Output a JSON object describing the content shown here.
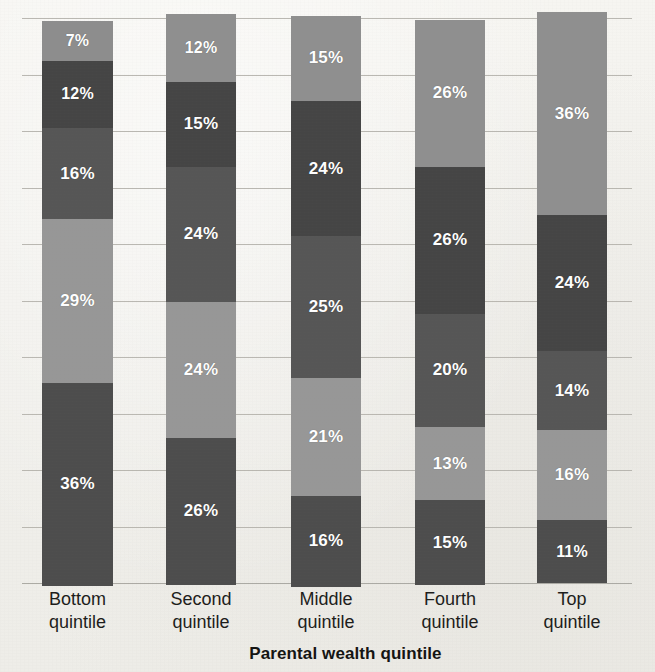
{
  "chart_data": {
    "type": "bar",
    "subtype": "stacked-100-percent",
    "title": "",
    "subtitle": "",
    "xlabel": "Parental wealth quintile",
    "ylabel": "",
    "categories": [
      "Bottom quintile",
      "Second quintile",
      "Middle quintile",
      "Fourth quintile",
      "Top quintile"
    ],
    "category_lines": [
      [
        "Bottom",
        "quintile"
      ],
      [
        "Second",
        "quintile"
      ],
      [
        "Middle",
        "quintile"
      ],
      [
        "Fourth",
        "quintile"
      ],
      [
        "Top",
        "quintile"
      ]
    ],
    "stack_order": "top-to-bottom",
    "series": [
      {
        "name": "Segment 1 (top)",
        "values": [
          7,
          12,
          15,
          26,
          36
        ],
        "color": "#8d8d8d"
      },
      {
        "name": "Segment 2",
        "values": [
          12,
          15,
          24,
          26,
          24
        ],
        "color": "#4b4b4b"
      },
      {
        "name": "Segment 3",
        "values": [
          16,
          24,
          25,
          20,
          14
        ],
        "color": "#555555"
      },
      {
        "name": "Segment 4",
        "values": [
          29,
          24,
          21,
          13,
          16
        ],
        "color": "#949494"
      },
      {
        "name": "Segment 5 (bottom)",
        "values": [
          36,
          26,
          16,
          15,
          11
        ],
        "color": "#4f4f4f"
      }
    ],
    "bars": [
      {
        "category": "Bottom quintile",
        "segments": [
          {
            "label": "7%",
            "value": 7,
            "color": "#8d8d8d"
          },
          {
            "label": "12%",
            "value": 12,
            "color": "#454545"
          },
          {
            "label": "16%",
            "value": 16,
            "color": "#565656"
          },
          {
            "label": "29%",
            "value": 29,
            "color": "#979797"
          },
          {
            "label": "36%",
            "value": 36,
            "color": "#4d4d4d"
          }
        ]
      },
      {
        "category": "Second quintile",
        "segments": [
          {
            "label": "12%",
            "value": 12,
            "color": "#8f8f8f"
          },
          {
            "label": "15%",
            "value": 15,
            "color": "#454545"
          },
          {
            "label": "24%",
            "value": 24,
            "color": "#565656"
          },
          {
            "label": "24%",
            "value": 24,
            "color": "#979797"
          },
          {
            "label": "26%",
            "value": 26,
            "color": "#4d4d4d"
          }
        ]
      },
      {
        "category": "Middle quintile",
        "segments": [
          {
            "label": "15%",
            "value": 15,
            "color": "#8f8f8f"
          },
          {
            "label": "24%",
            "value": 24,
            "color": "#454545"
          },
          {
            "label": "25%",
            "value": 25,
            "color": "#565656"
          },
          {
            "label": "21%",
            "value": 21,
            "color": "#979797"
          },
          {
            "label": "16%",
            "value": 16,
            "color": "#4d4d4d"
          }
        ]
      },
      {
        "category": "Fourth quintile",
        "segments": [
          {
            "label": "26%",
            "value": 26,
            "color": "#8f8f8f"
          },
          {
            "label": "26%",
            "value": 26,
            "color": "#454545"
          },
          {
            "label": "20%",
            "value": 20,
            "color": "#565656"
          },
          {
            "label": "13%",
            "value": 13,
            "color": "#979797"
          },
          {
            "label": "15%",
            "value": 15,
            "color": "#4d4d4d"
          }
        ]
      },
      {
        "category": "Top quintile",
        "segments": [
          {
            "label": "36%",
            "value": 36,
            "color": "#8f8f8f"
          },
          {
            "label": "24%",
            "value": 24,
            "color": "#454545"
          },
          {
            "label": "14%",
            "value": 14,
            "color": "#565656"
          },
          {
            "label": "16%",
            "value": 16,
            "color": "#979797"
          },
          {
            "label": "11%",
            "value": 11,
            "color": "#4d4d4d"
          }
        ]
      }
    ],
    "ylim": [
      0,
      100
    ],
    "grid": true,
    "gridline_count": 11,
    "legend": "none",
    "legend_position": "none",
    "data_labels": true,
    "data_label_color": "#ffffff",
    "background_color": "#f2f1ed",
    "gridline_color": "#b6b4ae"
  }
}
